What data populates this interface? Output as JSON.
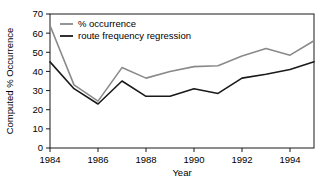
{
  "chart_data": {
    "type": "line",
    "title": "",
    "xlabel": "Year",
    "ylabel": "Computed % Occurrence",
    "x": [
      1984,
      1985,
      1986,
      1987,
      1988,
      1989,
      1990,
      1991,
      1992,
      1993,
      1994,
      1995
    ],
    "xlim": [
      1984,
      1995
    ],
    "ylim": [
      0,
      70
    ],
    "xticks": [
      1984,
      1986,
      1988,
      1990,
      1992,
      1994
    ],
    "xtick_labels": [
      "1984",
      "1986",
      "1988",
      "1990",
      "1992",
      "1994"
    ],
    "yticks": [
      0,
      10,
      20,
      30,
      40,
      50,
      60,
      70
    ],
    "ytick_labels": [
      "0",
      "10",
      "20",
      "30",
      "40",
      "50",
      "60",
      "70"
    ],
    "grid": false,
    "legend_position": "top-left-inside",
    "series": [
      {
        "name": "% occurrence",
        "color": "#8a8a8a",
        "values": [
          64,
          33,
          24.5,
          42,
          36.5,
          40,
          42.5,
          43,
          48,
          52,
          48.5,
          56
        ]
      },
      {
        "name": "route frequency regression",
        "color": "#1a1a1a",
        "values": [
          45,
          31,
          23,
          35,
          27,
          27,
          31,
          28.5,
          36.5,
          38.5,
          41,
          45
        ]
      }
    ]
  },
  "legend": {
    "entries": [
      {
        "label": "% occurrence"
      },
      {
        "label": "route frequency regression"
      }
    ]
  },
  "axes": {
    "x_title": "Year",
    "y_title": "Computed % Occurrence"
  }
}
